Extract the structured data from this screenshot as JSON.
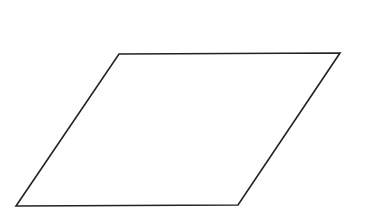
{
  "diagram": {
    "background": "#ffffff",
    "shapes": [
      {
        "type": "parallelogram",
        "points": [
          [
            119,
            54
          ],
          [
            340,
            53
          ],
          [
            238,
            205
          ],
          [
            16,
            206
          ]
        ],
        "stroke": "#222222",
        "stroke_width": 1.6,
        "fill": "none"
      }
    ]
  }
}
